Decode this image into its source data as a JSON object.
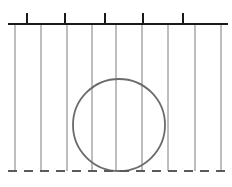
{
  "figure": {
    "width": 232,
    "height": 187,
    "background_color": "#ffffff"
  },
  "colors": {
    "wall_line": "#1a1a1a",
    "tick_mark": "#1a1a1a",
    "streamline": "#6e6e6e",
    "circle_outline": "#6b6b6b",
    "baseline_dashed": "#5a5a5a"
  },
  "top_wall": {
    "label": "top-wall",
    "y": 24,
    "x_start": 8,
    "x_end": 228,
    "stroke_width": 2.1
  },
  "tick_marks": {
    "label": "wall-ticks",
    "count": 5,
    "length": 11,
    "stroke_width": 2.0,
    "x_positions": [
      27,
      65,
      105,
      143,
      183
    ]
  },
  "streamlines": {
    "label": "vertical-streamlines",
    "count": 9,
    "stroke_width": 0.9,
    "y_top": 25,
    "y_bottom": 171,
    "x_positions": [
      15,
      41,
      67,
      92,
      116,
      142,
      168,
      195,
      221
    ]
  },
  "bubble": {
    "label": "circular-bubble",
    "center_x": 119,
    "center_y": 125,
    "radius": 46,
    "stroke_width": 1.8,
    "fill": "none"
  },
  "baseline": {
    "label": "bottom-dashed-baseline",
    "y": 171,
    "x_start": 8,
    "x_end": 228,
    "stroke_width": 1.8,
    "dash_pattern": "9 7"
  }
}
